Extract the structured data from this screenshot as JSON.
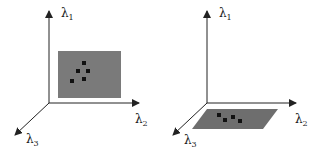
{
  "figure": {
    "panels": [
      {
        "id": "left",
        "description": "Point cluster within an upright plane spanned by lambda1 and lambda2",
        "axes": {
          "y": {
            "symbol": "λ",
            "sub": "1"
          },
          "x": {
            "symbol": "λ",
            "sub": "2"
          },
          "z": {
            "symbol": "λ",
            "sub": "3"
          }
        },
        "plane_color": "#7a7a7a",
        "point_color": "#111111",
        "points": 5
      },
      {
        "id": "right",
        "description": "Point cluster within a flat plane spanned by lambda2 and lambda3",
        "axes": {
          "y": {
            "symbol": "λ",
            "sub": "1"
          },
          "x": {
            "symbol": "λ",
            "sub": "2"
          },
          "z": {
            "symbol": "λ",
            "sub": "3"
          }
        },
        "plane_color": "#6e6e6e",
        "point_color": "#111111",
        "points": 4
      }
    ]
  }
}
